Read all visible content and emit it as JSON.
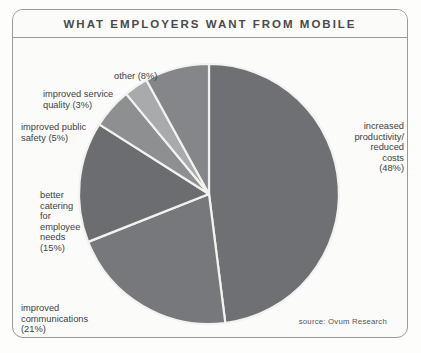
{
  "header": {
    "title": "WHAT EMPLOYERS WANT FROM MOBILE"
  },
  "footer": {
    "source": "source: Ovum Research"
  },
  "labels": {
    "other": "other (8%)",
    "improved_service_quality": "improved service\nquality (3%)",
    "improved_public_safety": "improved public\nsafety (5%)",
    "better_catering": "better\ncatering\nfor\nemployee\nneeds\n(15%)",
    "improved_communications": "improved\ncommunications\n(21%)",
    "increased_productivity": "increased\nproductivity/\nreduced\ncosts\n(48%)"
  },
  "chart_data": {
    "type": "pie",
    "title": "WHAT EMPLOYERS WANT FROM MOBILE",
    "subtitle": "",
    "xlabel": "",
    "ylabel": "",
    "legend_position": "callout-labels",
    "grid": false,
    "units": "percent",
    "total": 100,
    "start_angle_deg": -90,
    "direction": "clockwise",
    "center": {
      "x": 196,
      "y": 156
    },
    "radius": 130,
    "separator_color": "#f2f2f0",
    "separator_width": 2.2,
    "categories": [
      "increased productivity/reduced costs",
      "improved communications",
      "better catering for employee needs",
      "improved public safety",
      "improved service quality",
      "other"
    ],
    "values": [
      48,
      21,
      15,
      5,
      3,
      8
    ],
    "slices": [
      {
        "label": "increased productivity/reduced costs",
        "value": 48,
        "color": "#6f7073"
      },
      {
        "label": "improved communications",
        "value": 21,
        "color": "#77787b"
      },
      {
        "label": "better catering for employee needs",
        "value": 15,
        "color": "#6c6d70"
      },
      {
        "label": "improved public safety",
        "value": 5,
        "color": "#8e8f91"
      },
      {
        "label": "improved service quality",
        "value": 3,
        "color": "#a9aaac"
      },
      {
        "label": "other",
        "value": 8,
        "color": "#85868a"
      }
    ]
  },
  "colors": {
    "frame_border": "#9a9a9a",
    "background": "#fbfbfa",
    "title_text": "#4a4a4a",
    "label_text": "#3e3e3e"
  }
}
